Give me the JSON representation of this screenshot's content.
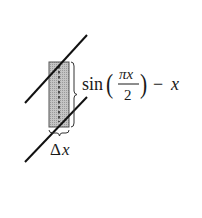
{
  "diagram": {
    "strip_height_label": {
      "func": "sin",
      "numerator": "πx",
      "denominator": "2",
      "minus": "−",
      "variable": "x"
    },
    "strip_width_label": {
      "delta": "Δ",
      "variable": "x"
    },
    "colors": {
      "line": "#111111",
      "strip_fill": "#bdbdbd",
      "strip_border": "#555555",
      "dotted_line": "#333333"
    }
  }
}
